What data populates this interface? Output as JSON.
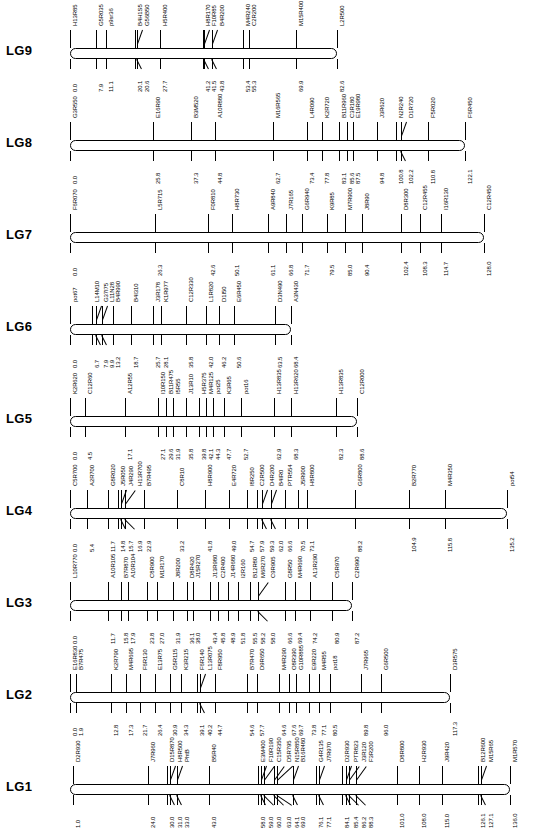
{
  "figure": {
    "orientation": "rotated-90",
    "unit": "cM",
    "line_color": "#000000",
    "background": "#ffffff"
  },
  "linkage_groups": [
    {
      "name": "LG1",
      "length": 136.0,
      "markers": [
        {
          "name": "D2R930",
          "pos": "1.0"
        },
        {
          "name": "J7R960",
          "pos": "24.0"
        },
        {
          "name": "D15R870",
          "pos": "30.0"
        },
        {
          "name": "H8R500",
          "pos": "31.0"
        },
        {
          "name": "PhtB",
          "pos": "33.0"
        },
        {
          "name": "B5R40",
          "pos": "43.0"
        },
        {
          "name": "E3M400",
          "pos": "58.0"
        },
        {
          "name": "F10R190",
          "pos": "59.0"
        },
        {
          "name": "C15R350",
          "pos": "60.0"
        },
        {
          "name": "D5R795",
          "pos": "63.0"
        },
        {
          "name": "N15R850",
          "pos": "64.1"
        },
        {
          "name": "B16R480",
          "pos": "69.0"
        },
        {
          "name": "G4R135",
          "pos": "76.1"
        },
        {
          "name": "J7R970",
          "pos": "77.1"
        },
        {
          "name": "D2R930",
          "pos": "84.1"
        },
        {
          "name": "PTR823",
          "pos": "85.4"
        },
        {
          "name": "J3R120",
          "pos": "86.2"
        },
        {
          "name": "F3R200",
          "pos": "88.3"
        },
        {
          "name": "D8R800",
          "pos": "101.0"
        },
        {
          "name": "H2R930",
          "pos": "108.0"
        },
        {
          "name": "J9R420",
          "pos": "115.0"
        },
        {
          "name": "B12R600",
          "pos": "126.1"
        },
        {
          "name": "M15R65",
          "pos": "127.1"
        },
        {
          "name": "M1R570",
          "pos": "136.0"
        }
      ]
    },
    {
      "name": "LG2",
      "length": 117.3,
      "markers": [
        {
          "name": "E16R830",
          "pos": "0.0"
        },
        {
          "name": "B7R475",
          "pos": "1.9"
        },
        {
          "name": "K2R790",
          "pos": "12.8"
        },
        {
          "name": "M4R695",
          "pos": "17.3"
        },
        {
          "name": "F6R130",
          "pos": "21.7"
        },
        {
          "name": "E13R75",
          "pos": "26.4"
        },
        {
          "name": "G5R115",
          "pos": "30.9"
        },
        {
          "name": "K3R215",
          "pos": "34.3"
        },
        {
          "name": "F6R140",
          "pos": "39.1"
        },
        {
          "name": "L13R075",
          "pos": "40.2"
        },
        {
          "name": "F8R950",
          "pos": "44.7"
        },
        {
          "name": "B7R470",
          "pos": "54.6"
        },
        {
          "name": "D9R650",
          "pos": "57.7"
        },
        {
          "name": "M4R290",
          "pos": "64.6"
        },
        {
          "name": "O8R390",
          "pos": "67.6"
        },
        {
          "name": "G10R885",
          "pos": "69.7"
        },
        {
          "name": "E9R220",
          "pos": "73.8"
        },
        {
          "name": "M4R55",
          "pos": "77.1"
        },
        {
          "name": "pot18",
          "pos": "80.5"
        },
        {
          "name": "J7R965",
          "pos": "89.8"
        },
        {
          "name": "G6R500",
          "pos": "96.0"
        },
        {
          "name": "D3R575",
          "pos": "117.3"
        }
      ]
    },
    {
      "name": "LG3",
      "length": 87.2,
      "markers": [
        {
          "name": "L10R770",
          "pos": "0.0"
        },
        {
          "name": "A10R105",
          "pos": "11.7"
        },
        {
          "name": "B7R870",
          "pos": "15.8"
        },
        {
          "name": "A10R104",
          "pos": "17.9"
        },
        {
          "name": "C8R900",
          "pos": "23.8"
        },
        {
          "name": "M1R170",
          "pos": "27.0"
        },
        {
          "name": "J8R200",
          "pos": "31.9"
        },
        {
          "name": "D8R420",
          "pos": "36.1"
        },
        {
          "name": "J15R270",
          "pos": "38.0"
        },
        {
          "name": "J13R980",
          "pos": "43.4"
        },
        {
          "name": "C2R400",
          "pos": "45.8"
        },
        {
          "name": "J14R680",
          "pos": "48.9"
        },
        {
          "name": "I2R160",
          "pos": "51.8"
        },
        {
          "name": "B12R80",
          "pos": "55.5"
        },
        {
          "name": "M6R270",
          "pos": "58.2"
        },
        {
          "name": "C9R905",
          "pos": "58.0"
        },
        {
          "name": "G8R50",
          "pos": "66.6"
        },
        {
          "name": "M4R690",
          "pos": "69.4"
        },
        {
          "name": "A13R290",
          "pos": "74.2"
        },
        {
          "name": "C5R970",
          "pos": "80.9"
        },
        {
          "name": "C2R990",
          "pos": "87.2"
        }
      ]
    },
    {
      "name": "LG4",
      "length": 135.2,
      "markers": [
        {
          "name": "C5R700",
          "pos": "0.0"
        },
        {
          "name": "A2R700",
          "pos": "5.4"
        },
        {
          "name": "G8R020",
          "pos": "11.7"
        },
        {
          "name": "J5R050",
          "pos": "14.8"
        },
        {
          "name": "J4R290",
          "pos": "15.7"
        },
        {
          "name": "H13R700",
          "pos": "16.9"
        },
        {
          "name": "B7R495",
          "pos": "22.9"
        },
        {
          "name": "C8R10",
          "pos": "33.2"
        },
        {
          "name": "H8R900",
          "pos": "41.8"
        },
        {
          "name": "E4R720",
          "pos": "49.0"
        },
        {
          "name": "I8R250",
          "pos": "54.7"
        },
        {
          "name": "C2R500",
          "pos": "57.9"
        },
        {
          "name": "D4R200",
          "pos": "59.3"
        },
        {
          "name": "B4IR0",
          "pos": "62.0"
        },
        {
          "name": "PTR554",
          "pos": "66.6"
        },
        {
          "name": "J5R900",
          "pos": "70.5"
        },
        {
          "name": "H8R800",
          "pos": "73.1"
        },
        {
          "name": "G6R800",
          "pos": "88.2"
        },
        {
          "name": "B2R770",
          "pos": "104.9"
        },
        {
          "name": "M4R350",
          "pos": "115.8"
        },
        {
          "name": "pot54",
          "pos": "135.2"
        }
      ]
    },
    {
      "name": "LG5",
      "length": 88.6,
      "markers": [
        {
          "name": "K2R620",
          "pos": "0.0"
        },
        {
          "name": "C12R60",
          "pos": "4.5"
        },
        {
          "name": "A12R55",
          "pos": "17.1"
        },
        {
          "name": "I10R150",
          "pos": "27.1"
        },
        {
          "name": "B11R475",
          "pos": "29.6"
        },
        {
          "name": "I5R55",
          "pos": "31.9"
        },
        {
          "name": "J13R10",
          "pos": "35.8"
        },
        {
          "name": "H5R375",
          "pos": "39.8"
        },
        {
          "name": "M4R125",
          "pos": "42.1"
        },
        {
          "name": "pot25",
          "pos": "44.3"
        },
        {
          "name": "K3R65",
          "pos": "47.7"
        },
        {
          "name": "pot16",
          "pos": "52.7"
        },
        {
          "name": "H13R835",
          "pos": "62.9"
        },
        {
          "name": "H13R620",
          "pos": "68.3"
        },
        {
          "name": "H13R835",
          "pos": "82.3"
        },
        {
          "name": "C12R000",
          "pos": "88.6"
        }
      ]
    },
    {
      "name": "LG6",
      "length": 68.4,
      "markers": [
        {
          "name": "pot67",
          "pos": "0.0"
        },
        {
          "name": "L14M10",
          "pos": "6.7"
        },
        {
          "name": "G37I75",
          "pos": "7.9"
        },
        {
          "name": "L11N28",
          "pos": "9.9"
        },
        {
          "name": "B4R990",
          "pos": "13.2"
        },
        {
          "name": "B4I310",
          "pos": "18.7"
        },
        {
          "name": "J3R178",
          "pos": "25.7"
        },
        {
          "name": "K1R977",
          "pos": "28.1"
        },
        {
          "name": "C12R330",
          "pos": "35.8"
        },
        {
          "name": "L1R820",
          "pos": "42.0"
        },
        {
          "name": "D1I50",
          "pos": "46.2"
        },
        {
          "name": "E6R450",
          "pos": "50.6"
        },
        {
          "name": "D3N490",
          "pos": "63.5"
        },
        {
          "name": "A3N430",
          "pos": "68.4"
        }
      ]
    },
    {
      "name": "LG7",
      "length": 128.0,
      "markers": [
        {
          "name": "F6R070",
          "pos": "0.0"
        },
        {
          "name": "L5R715",
          "pos": "26.3"
        },
        {
          "name": "F0R810",
          "pos": "42.6"
        },
        {
          "name": "H8R730",
          "pos": "50.1"
        },
        {
          "name": "A9R840",
          "pos": "61.1"
        },
        {
          "name": "J7R165",
          "pos": "66.8"
        },
        {
          "name": "G6R940",
          "pos": "71.7"
        },
        {
          "name": "K9R85",
          "pos": "79.5"
        },
        {
          "name": "M7R900",
          "pos": "85.0"
        },
        {
          "name": "J8R90",
          "pos": "90.4"
        },
        {
          "name": "D8R300",
          "pos": "102.4"
        },
        {
          "name": "C12R455",
          "pos": "108.3"
        },
        {
          "name": "I16R130",
          "pos": "114.7"
        },
        {
          "name": "C12R450",
          "pos": "128.0"
        }
      ]
    },
    {
      "name": "LG8",
      "length": 122.1,
      "markers": [
        {
          "name": "G3R550",
          "pos": "0.0"
        },
        {
          "name": "E16R90",
          "pos": "25.8"
        },
        {
          "name": "B3M520",
          "pos": "37.3"
        },
        {
          "name": "A10R880",
          "pos": "44.8"
        },
        {
          "name": "M16R565",
          "pos": "62.7"
        },
        {
          "name": "L4R090",
          "pos": "73.4"
        },
        {
          "name": "K2R720",
          "pos": "77.8"
        },
        {
          "name": "B11R960",
          "pos": "83.1"
        },
        {
          "name": "C3R180",
          "pos": "85.6"
        },
        {
          "name": "E19R980",
          "pos": "87.5"
        },
        {
          "name": "J3R620",
          "pos": "94.8"
        },
        {
          "name": "N2R240",
          "pos": "100.8"
        },
        {
          "name": "D1R720",
          "pos": "102.2"
        },
        {
          "name": "F5R020",
          "pos": "110.8"
        },
        {
          "name": "F6R450",
          "pos": "122.1"
        }
      ]
    },
    {
      "name": "LG9",
      "length": 82.6,
      "markers": [
        {
          "name": "H13R85",
          "pos": "0.0"
        },
        {
          "name": "G5R035",
          "pos": "7.9"
        },
        {
          "name": "p9sr36",
          "pos": "11.1"
        },
        {
          "name": "B4H1S5",
          "pos": "20.1"
        },
        {
          "name": "G56B50",
          "pos": "20.6"
        },
        {
          "name": "H5R400",
          "pos": "27.7"
        },
        {
          "name": "H8R170",
          "pos": "41.2"
        },
        {
          "name": "F10R85",
          "pos": "41.5"
        },
        {
          "name": "B4R200",
          "pos": "43.8"
        },
        {
          "name": "M4R240",
          "pos": "53.4"
        },
        {
          "name": "C2R200",
          "pos": "55.3"
        },
        {
          "name": "M15R400",
          "pos": "69.9"
        },
        {
          "name": "L2R500",
          "pos": "82.6"
        }
      ]
    }
  ]
}
